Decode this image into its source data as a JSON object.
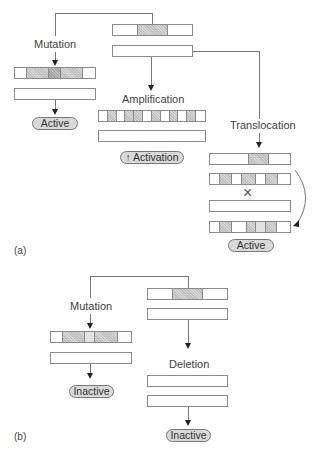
{
  "panel_a": {
    "label": "(a)",
    "mutation": {
      "label": "Mutation",
      "result": "Active"
    },
    "amplification": {
      "label": "Amplification",
      "result": "↑ Activation"
    },
    "translocation": {
      "label": "Translocation",
      "result": "Active",
      "cross_symbol": "×"
    }
  },
  "panel_b": {
    "label": "(b)",
    "mutation": {
      "label": "Mutation",
      "result": "Inactive"
    },
    "deletion": {
      "label": "Deletion",
      "result": "Inactive"
    }
  },
  "colors": {
    "line": "#777777",
    "arrow": "#222222",
    "shaded_segment": "#d6d6d6",
    "pill_fill": "#d9d9d9"
  }
}
